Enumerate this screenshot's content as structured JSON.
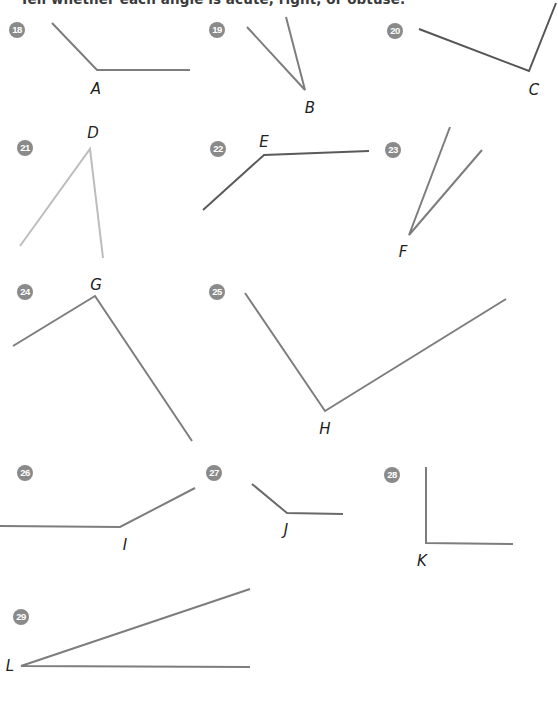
{
  "heading": "Tell whether each angle is acute, right, or obtuse.",
  "exercises": [
    {
      "number": "18",
      "vertex_label": "A",
      "badge": [
        9,
        22
      ],
      "label_pos": [
        96,
        89
      ],
      "vertex": [
        97,
        70
      ],
      "rays": [
        [
          52,
          23
        ],
        [
          190,
          70
        ]
      ],
      "color": "#7d7d7d"
    },
    {
      "number": "19",
      "vertex_label": "B",
      "badge": [
        209,
        22
      ],
      "label_pos": [
        310,
        108
      ],
      "vertex": [
        305,
        90
      ],
      "rays": [
        [
          247,
          27
        ],
        [
          286,
          17
        ]
      ],
      "color": "#7d7d7d"
    },
    {
      "number": "20",
      "vertex_label": "C",
      "badge": [
        387,
        23
      ],
      "label_pos": [
        534,
        90
      ],
      "vertex": [
        529,
        71
      ],
      "rays": [
        [
          419,
          29
        ],
        [
          556,
          3
        ]
      ],
      "color": "#555555"
    },
    {
      "number": "21",
      "vertex_label": "D",
      "badge": [
        17,
        140
      ],
      "label_pos": [
        93,
        133
      ],
      "vertex": [
        90,
        149
      ],
      "rays": [
        [
          20,
          246
        ],
        [
          103,
          258
        ]
      ],
      "color": "#bdbdbd"
    },
    {
      "number": "22",
      "vertex_label": "E",
      "badge": [
        210,
        141
      ],
      "label_pos": [
        264,
        142
      ],
      "vertex": [
        264,
        155
      ],
      "rays": [
        [
          203,
          210
        ],
        [
          369,
          151
        ]
      ],
      "color": "#5a5a5a"
    },
    {
      "number": "23",
      "vertex_label": "F",
      "badge": [
        385,
        142
      ],
      "label_pos": [
        403,
        252
      ],
      "vertex": [
        409,
        235
      ],
      "rays": [
        [
          450,
          127
        ],
        [
          482,
          150
        ]
      ],
      "color": "#7d7d7d"
    },
    {
      "number": "24",
      "vertex_label": "G",
      "badge": [
        17,
        284
      ],
      "label_pos": [
        96,
        285
      ],
      "vertex": [
        95,
        296
      ],
      "rays": [
        [
          13,
          346
        ],
        [
          192,
          441
        ]
      ],
      "color": "#7d7d7d"
    },
    {
      "number": "25",
      "vertex_label": "H",
      "badge": [
        209,
        284
      ],
      "label_pos": [
        325,
        429
      ],
      "vertex": [
        325,
        411
      ],
      "rays": [
        [
          245,
          293
        ],
        [
          506,
          299
        ]
      ],
      "color": "#7d7d7d"
    },
    {
      "number": "26",
      "vertex_label": "I",
      "badge": [
        17,
        465
      ],
      "label_pos": [
        125,
        545
      ],
      "vertex": [
        120,
        527
      ],
      "rays": [
        [
          0,
          526
        ],
        [
          195,
          488
        ]
      ],
      "color": "#7d7d7d"
    },
    {
      "number": "27",
      "vertex_label": "J",
      "badge": [
        206,
        465
      ],
      "label_pos": [
        286,
        530
      ],
      "vertex": [
        287,
        513
      ],
      "rays": [
        [
          252,
          484
        ],
        [
          343,
          514
        ]
      ],
      "color": "#6a6a6a"
    },
    {
      "number": "28",
      "vertex_label": "K",
      "badge": [
        384,
        467
      ],
      "label_pos": [
        422,
        561
      ],
      "vertex": [
        426,
        543
      ],
      "rays": [
        [
          426,
          467
        ],
        [
          513,
          544
        ]
      ],
      "color": "#7d7d7d"
    },
    {
      "number": "29",
      "vertex_label": "L",
      "badge": [
        13,
        609
      ],
      "label_pos": [
        10,
        666
      ],
      "vertex": [
        21,
        666
      ],
      "rays": [
        [
          250,
          589
        ],
        [
          250,
          667
        ]
      ],
      "color": "#7d7d7d"
    }
  ]
}
